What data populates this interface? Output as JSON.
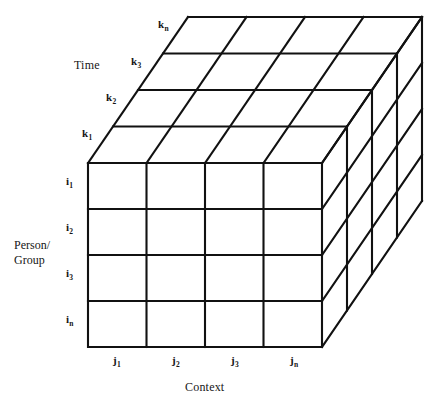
{
  "figure": {
    "name": "three-dimensional-data-cube",
    "background_color": "#ffffff",
    "line_color": "#111111",
    "axes": {
      "time": {
        "title": "Time",
        "ticks": [
          {
            "base": "k",
            "sub": "1",
            "text": "k1"
          },
          {
            "base": "k",
            "sub": "2",
            "text": "k2"
          },
          {
            "base": "k",
            "sub": "3",
            "text": "k3"
          },
          {
            "base": "k",
            "sub": "n",
            "text": "kn"
          }
        ]
      },
      "person_group": {
        "title_line1": "Person/",
        "title_line2": "Group",
        "ticks": [
          {
            "base": "i",
            "sub": "1",
            "text": "i1"
          },
          {
            "base": "i",
            "sub": "2",
            "text": "i2"
          },
          {
            "base": "i",
            "sub": "3",
            "text": "i3"
          },
          {
            "base": "i",
            "sub": "n",
            "text": "in"
          }
        ]
      },
      "context": {
        "title": "Context",
        "ticks": [
          {
            "base": "j",
            "sub": "1",
            "text": "j1"
          },
          {
            "base": "j",
            "sub": "2",
            "text": "j2"
          },
          {
            "base": "j",
            "sub": "3",
            "text": "j3"
          },
          {
            "base": "j",
            "sub": "n",
            "text": "jn"
          }
        ]
      }
    },
    "grid": {
      "columns": 4,
      "rows": 4,
      "depth": 4
    }
  }
}
